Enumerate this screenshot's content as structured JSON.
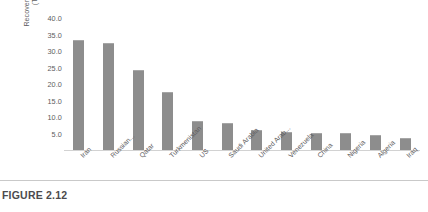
{
  "caption": "FIGURE 2.12",
  "chart_data": {
    "type": "bar",
    "title": "",
    "xlabel": "",
    "ylabel": "Recoverable Natural Gas Reserves\n(Trillion Cubic Metres)",
    "ylim": [
      0,
      40
    ],
    "ytick_labels": [
      "40.0",
      "35.0",
      "30.0",
      "25.0",
      "20.0",
      "15.0",
      "10.0",
      "5.0"
    ],
    "ytick_values": [
      40,
      35,
      30,
      25,
      20,
      15,
      10,
      5
    ],
    "grid": false,
    "legend": null,
    "bar_color": "#8d8d8d",
    "categories": [
      "Iran",
      "Russian...",
      "Qatar",
      "Turkmenistan",
      "US",
      "Saudi Arabia",
      "United Arab...",
      "Venezuela",
      "China",
      "Nigeria",
      "Algeria",
      "Iraq"
    ],
    "values": [
      33.2,
      32.3,
      24.1,
      17.5,
      8.7,
      8.2,
      6.1,
      5.6,
      5.2,
      5.1,
      4.5,
      3.6
    ]
  }
}
